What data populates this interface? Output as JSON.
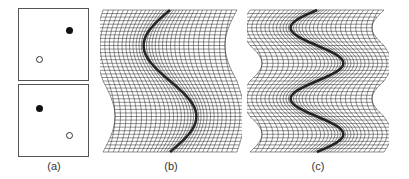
{
  "panels": [
    {
      "id": "a",
      "label": "(a)",
      "subplots": [
        {
          "filled_point": [
            0.72,
            0.22
          ],
          "hollow_point": [
            0.22,
            0.7
          ]
        },
        {
          "filled_point": [
            0.22,
            0.3
          ],
          "hollow_point": [
            0.72,
            0.72
          ]
        }
      ]
    },
    {
      "id": "b",
      "label": "(b)",
      "warp": "single-s-curve"
    },
    {
      "id": "c",
      "label": "(c)",
      "warp": "double-s-curve"
    }
  ],
  "colors": {
    "line": "#222222",
    "frame": "#555555",
    "background": "#ffffff"
  }
}
